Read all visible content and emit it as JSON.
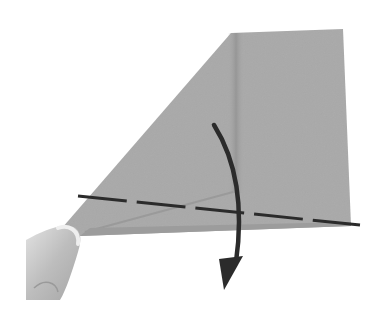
{
  "figure": {
    "kind": "paper-folding instruction step"
  },
  "colors": {
    "background": "#ffffff",
    "paper": "#a9a9a9",
    "paper_dark": "#999999",
    "crease_shadow": "#8f8f8f",
    "ink": "#2b2b2b",
    "thumb": "#b8b8b8",
    "thumb_light": "#d8d8d8"
  },
  "paper": {
    "points": "231,33 343,29 351,226 80,236 62,228"
  },
  "fold_line": {
    "style": "dashed",
    "x1": 78,
    "y1": 196,
    "x2": 360,
    "y2": 225
  },
  "arrow": {
    "direction": "down",
    "path": "M214,125 C236,160 244,205 236,262",
    "head": "224,290 219,259 243,256"
  },
  "hand": {
    "present": true,
    "part": "thumb"
  }
}
